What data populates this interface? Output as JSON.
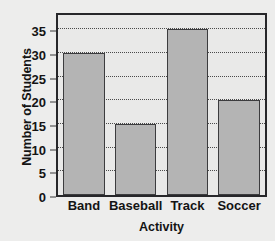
{
  "chart_data": {
    "type": "bar",
    "title": "",
    "categories": [
      "Band",
      "Baseball",
      "Track",
      "Soccer"
    ],
    "values": [
      30,
      15,
      35,
      20
    ],
    "xlabel": "Activity",
    "ylabel": "Number of Students",
    "ylim": [
      0,
      38
    ],
    "yticks": [
      0,
      5,
      10,
      15,
      20,
      25,
      30,
      35
    ],
    "ytick_labels": [
      "0",
      "5",
      "10",
      "15",
      "20",
      "25",
      "30",
      "35"
    ],
    "grid": "horizontal-dotted",
    "legend": "none",
    "colors": {
      "bar_fill": "#b4b4b4",
      "bar_edge": "#3c3c3e",
      "plot_background": "#e9e9e8",
      "plot_border": "#27272a",
      "page_background": "#ededec",
      "gridline": "#4a4a4a",
      "text": "#141414"
    }
  }
}
